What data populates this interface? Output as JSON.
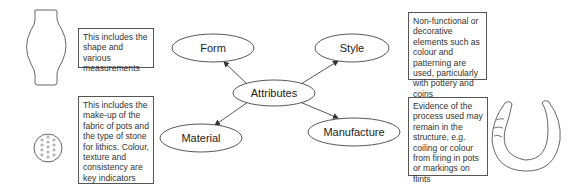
{
  "diagram": {
    "type": "mind-map",
    "center": {
      "label": "Attributes"
    },
    "nodes": [
      {
        "id": "form",
        "label": "Form",
        "description": "This includes the shape and various measurements",
        "illustration": "vase-outline-icon"
      },
      {
        "id": "style",
        "label": "Style",
        "description": "Non-functional or decorative elements such as colour and patterning are used, particularly with pottery and coins",
        "illustration": "none"
      },
      {
        "id": "material",
        "label": "Material",
        "description": "This includes the make-up of the fabric of pots and the type of stone for lithics. Colour, texture and consistency are key indicators",
        "illustration": "dotted-circle-sample-icon"
      },
      {
        "id": "manufacture",
        "label": "Manufacture",
        "description": "Evidence of the process used may remain in the structure, e.g. coiling or colour from firing in pots or markings on flints",
        "illustration": "coiled-pot-section-icon"
      }
    ],
    "edges": [
      {
        "from": "Attributes",
        "to": "Form"
      },
      {
        "from": "Attributes",
        "to": "Style"
      },
      {
        "from": "Attributes",
        "to": "Material"
      },
      {
        "from": "Attributes",
        "to": "Manufacture"
      }
    ],
    "colors": {
      "stroke": "#444444",
      "background": "#ffffff",
      "text": "#222222"
    }
  }
}
